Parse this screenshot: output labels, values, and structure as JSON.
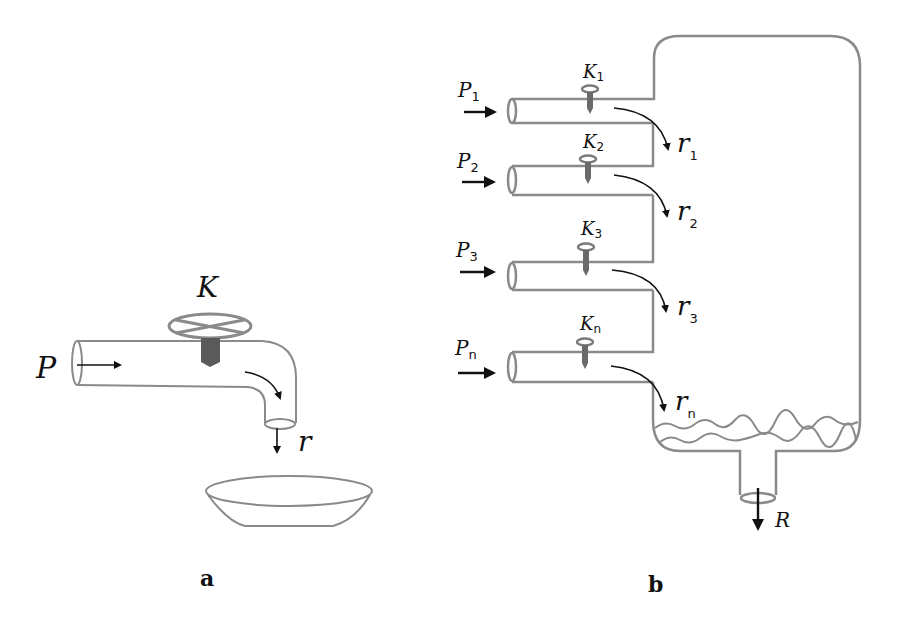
{
  "diagram": {
    "panel_a": {
      "caption": "a",
      "valve_label": "K",
      "pressure_label": "P",
      "flow_label": "r",
      "colors": {
        "pipe": "#8a8a8a",
        "valve_stem": "#5a5a5a",
        "arrow": "#111111"
      }
    },
    "panel_b": {
      "caption": "b",
      "inlets": [
        {
          "pressure": "P",
          "pressure_sub": "1",
          "valve": "K",
          "valve_sub": "1",
          "flow": "r",
          "flow_sub": "1"
        },
        {
          "pressure": "P",
          "pressure_sub": "2",
          "valve": "K",
          "valve_sub": "2",
          "flow": "r",
          "flow_sub": "2"
        },
        {
          "pressure": "P",
          "pressure_sub": "3",
          "valve": "K",
          "valve_sub": "3",
          "flow": "r",
          "flow_sub": "3"
        },
        {
          "pressure": "P",
          "pressure_sub": "n",
          "valve": "K",
          "valve_sub": "n",
          "flow": "r",
          "flow_sub": "n"
        }
      ],
      "outlet_label": "R",
      "colors": {
        "tank": "#8a8a8a",
        "arrow": "#111111"
      }
    }
  }
}
